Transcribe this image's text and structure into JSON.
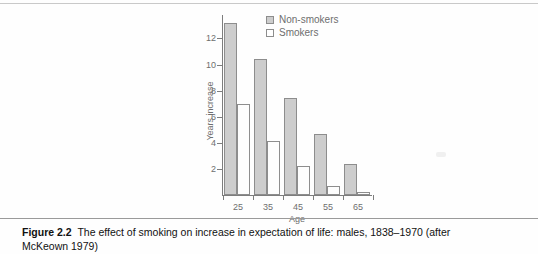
{
  "figure": {
    "caption_label": "Figure 2.2",
    "caption_text": "The effect of smoking on increase in expectation of life: males, 1838–1970 (after McKeown 1979)"
  },
  "legend": {
    "position": "top-right-inside",
    "items": [
      {
        "label": "Non-smokers",
        "swatch": "filled-gray-square",
        "color": "#cdcdcd"
      },
      {
        "label": "Smokers",
        "swatch": "empty-white-square",
        "color": "#ffffff"
      }
    ]
  },
  "chart_data": {
    "type": "bar",
    "title": "",
    "subtitle": "",
    "xlabel": "Age",
    "ylabel": "Years increase",
    "categories": [
      "25",
      "35",
      "45",
      "55",
      "65"
    ],
    "series": [
      {
        "name": "Non-smokers",
        "values": [
          13.2,
          10.4,
          7.4,
          4.65,
          2.35
        ],
        "color": "#cdcdcd"
      },
      {
        "name": "Smokers",
        "values": [
          7.0,
          4.15,
          2.2,
          0.7,
          0.25
        ],
        "color": "#ffffff"
      }
    ],
    "ylim": [
      0,
      13.8
    ],
    "yticks": [
      2,
      4,
      6,
      8,
      10,
      12
    ],
    "ytick_labels": [
      "2",
      "4",
      "6",
      "8",
      "10",
      "12"
    ],
    "xtick_labels": [
      "25",
      "35",
      "45",
      "55",
      "65"
    ],
    "grid": false,
    "legend_position": "upper right",
    "annotations": []
  }
}
